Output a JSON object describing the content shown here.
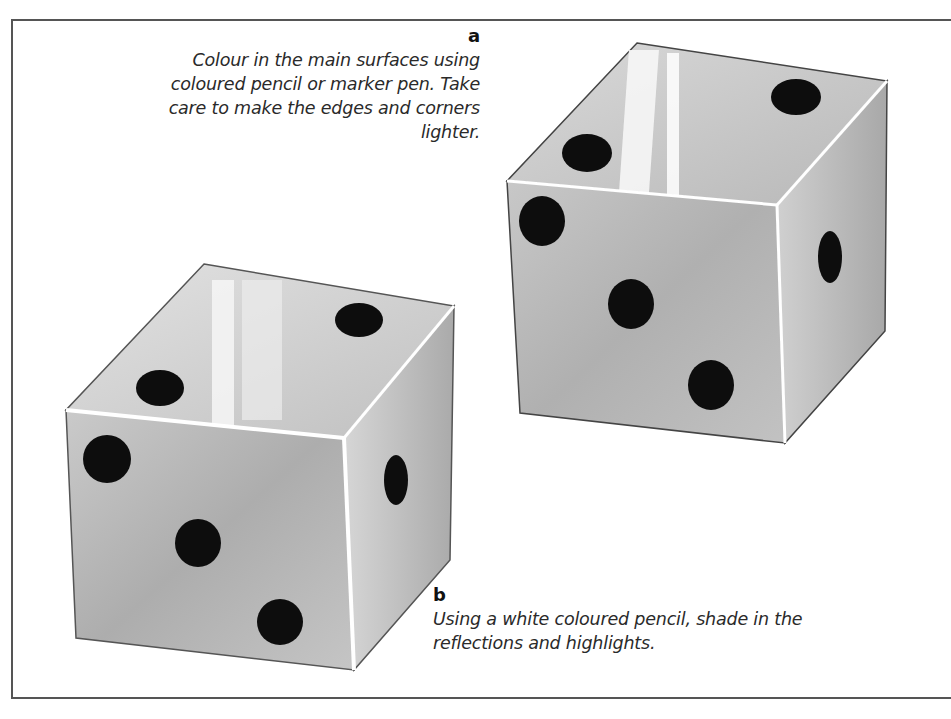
{
  "figure": {
    "step_a": {
      "label": "a",
      "text": "Colour in the main surfaces using coloured pencil or marker pen. Take care to make the edges and corners lighter."
    },
    "step_b": {
      "label": "b",
      "text": "Using a white coloured pencil, shade in the reflections and highlights."
    },
    "illustrations": [
      {
        "name": "die-a",
        "description": "Die coloured with main surface shading, lighter edges and corners",
        "faces": {
          "top": 2,
          "front": 3,
          "side": 1
        }
      },
      {
        "name": "die-b",
        "description": "Die with white highlights and reflections added",
        "faces": {
          "top": 2,
          "front": 3,
          "side": 1
        }
      }
    ],
    "colors": {
      "frame": "#555555",
      "die_surface": "#bdbdbd",
      "pip": "#0d0d0d",
      "highlight": "#ffffff"
    }
  }
}
